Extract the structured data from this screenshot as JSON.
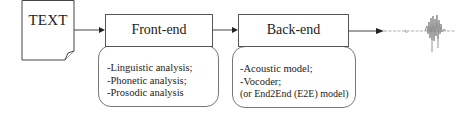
{
  "diagram": {
    "input": {
      "label": "TEXT",
      "icon": "document-icon"
    },
    "stages": [
      {
        "title": "Front-end",
        "items": [
          "-Linguistic analysis;",
          "-Phonetic analysis;",
          "-Prosodic analysis"
        ]
      },
      {
        "title": "Back-end",
        "items": [
          "-Acoustic model;",
          "-Vocoder;",
          "(or End2End (E2E) model)"
        ]
      }
    ],
    "output": {
      "icon": "speech-waveform-icon"
    },
    "colors": {
      "line": "#444444",
      "box_border": "#555555",
      "background": "#ffffff"
    }
  }
}
